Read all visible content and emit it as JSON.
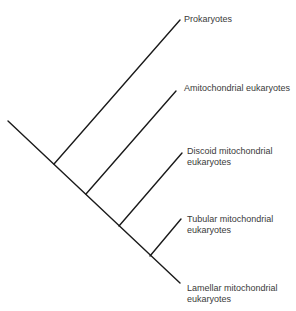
{
  "diagram": {
    "type": "cladogram",
    "line_color": "#1a1a1a",
    "taxa": [
      {
        "id": "prokaryotes",
        "line1": "Prokaryotes",
        "line2": ""
      },
      {
        "id": "amitochondrial",
        "line1": "Amitochondrial eukaryotes",
        "line2": ""
      },
      {
        "id": "discoid",
        "line1": "Discoid mitochondrial",
        "line2": "eukaryotes"
      },
      {
        "id": "tubular",
        "line1": "Tubular mitochondrial",
        "line2": "eukaryotes"
      },
      {
        "id": "lamellar",
        "line1": "Lamellar mitochondrial",
        "line2": "eukaryotes"
      }
    ]
  }
}
